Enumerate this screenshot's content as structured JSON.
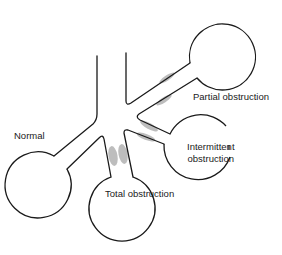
{
  "diagram": {
    "colors": {
      "stroke": "#1a1a1a",
      "shading": "#a8a8a8",
      "background": "#ffffff"
    },
    "labels": {
      "normal": "Normal",
      "partial": "Partial obstruction",
      "intermittent_line1": "Intermittent",
      "intermittent_line2": "obstruction",
      "total": "Total obstruction"
    },
    "alveoli": [
      {
        "id": "partial",
        "cx": 222,
        "cy": 52,
        "r": 33
      },
      {
        "id": "normal",
        "cx": 41,
        "cy": 188,
        "r": 33
      },
      {
        "id": "total",
        "cx": 126,
        "cy": 210,
        "r": 33
      },
      {
        "id": "intermittent",
        "cx": 198,
        "cy": 148,
        "r": 34
      }
    ]
  }
}
